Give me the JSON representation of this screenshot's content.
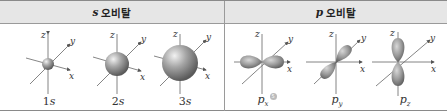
{
  "header": {
    "s_symbol": "s",
    "s_title": "오비탈",
    "p_symbol": "p",
    "p_title": "오비탈"
  },
  "axes": {
    "x": "x",
    "y": "y",
    "z": "z"
  },
  "s_orbitals": [
    {
      "num": "1",
      "sym": "s",
      "radius": 6
    },
    {
      "num": "2",
      "sym": "s",
      "radius": 11
    },
    {
      "num": "3",
      "sym": "s",
      "radius": 17
    }
  ],
  "p_orbitals": [
    {
      "sym": "p",
      "sub": "x",
      "badge": "5"
    },
    {
      "sym": "p",
      "sub": "y"
    },
    {
      "sym": "p",
      "sub": "z"
    }
  ],
  "colors": {
    "header_bg": "#e6e6e6",
    "border": "#8a8a8a",
    "orbital_fill": "#8a8a8a",
    "axis": "#555555"
  }
}
